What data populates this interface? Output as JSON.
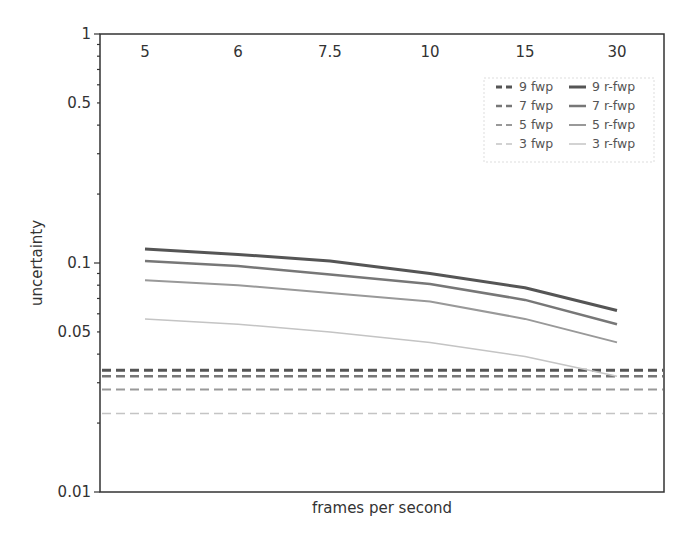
{
  "chart_data": {
    "type": "line",
    "title": "",
    "xlabel": "frames per second",
    "ylabel": "uncertainty",
    "yscale": "log",
    "ylim": [
      0.01,
      1
    ],
    "y_ticks": [
      "1",
      "0.5",
      "0.1",
      "0.05",
      "0.01"
    ],
    "categories": [
      "5",
      "6",
      "7.5",
      "10",
      "15",
      "30"
    ],
    "legend_position": "upper right",
    "grid": false,
    "series": [
      {
        "name": "9 fwp",
        "style": "dashed",
        "color": "#555555",
        "width": 3,
        "values": [
          0.034,
          0.034,
          0.034,
          0.034,
          0.034,
          0.034
        ]
      },
      {
        "name": "7 fwp",
        "style": "dashed",
        "color": "#777777",
        "width": 2.5,
        "values": [
          0.032,
          0.032,
          0.032,
          0.032,
          0.032,
          0.032
        ]
      },
      {
        "name": "5 fwp",
        "style": "dashed",
        "color": "#999999",
        "width": 2,
        "values": [
          0.028,
          0.028,
          0.028,
          0.028,
          0.028,
          0.028
        ]
      },
      {
        "name": "3 fwp",
        "style": "dashed",
        "color": "#c4c4c4",
        "width": 1.5,
        "values": [
          0.022,
          0.022,
          0.022,
          0.022,
          0.022,
          0.022
        ]
      },
      {
        "name": "9 r-fwp",
        "style": "solid",
        "color": "#555555",
        "width": 3,
        "values": [
          0.115,
          0.109,
          0.102,
          0.09,
          0.078,
          0.062
        ]
      },
      {
        "name": "7 r-fwp",
        "style": "solid",
        "color": "#777777",
        "width": 2.5,
        "values": [
          0.102,
          0.097,
          0.089,
          0.081,
          0.069,
          0.054
        ]
      },
      {
        "name": "5 r-fwp",
        "style": "solid",
        "color": "#999999",
        "width": 2,
        "values": [
          0.084,
          0.08,
          0.074,
          0.068,
          0.057,
          0.045
        ]
      },
      {
        "name": "3 r-fwp",
        "style": "solid",
        "color": "#c4c4c4",
        "width": 1.5,
        "values": [
          0.057,
          0.054,
          0.05,
          0.045,
          0.039,
          0.032
        ]
      }
    ]
  }
}
